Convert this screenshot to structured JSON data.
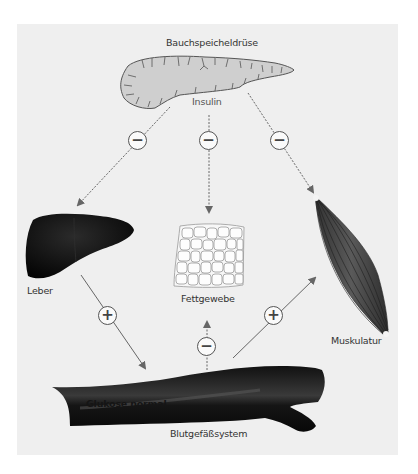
{
  "diagram": {
    "organs": {
      "pancreas": {
        "label": "Bauchspeicheldrüse"
      },
      "liver": {
        "label": "Leber"
      },
      "fat": {
        "label": "Fettgewebe"
      },
      "muscle": {
        "label": "Muskulatur"
      },
      "blood": {
        "label": "Blutgefäßsystem",
        "inner_label": "Glukose normal"
      }
    },
    "hormone": {
      "label": "Insulin"
    },
    "signs": {
      "pancreas_liver": "−",
      "pancreas_fat": "−",
      "pancreas_muscle": "−",
      "liver_blood": "+",
      "blood_muscle": "+",
      "blood_fat": "−"
    },
    "colors": {
      "panel": "#efefef",
      "arrow": "#666666",
      "pancreas": "#cfcfcf",
      "organ_dark": "#1a1a1a",
      "muscle": "#4a4a4a"
    }
  }
}
